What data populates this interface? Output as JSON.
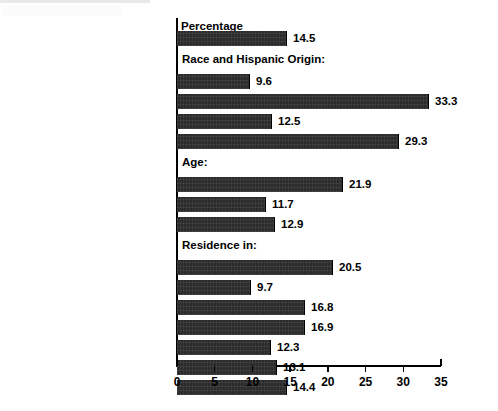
{
  "chart_data": {
    "type": "bar",
    "orientation": "horizontal",
    "title": "Percentage",
    "xlabel": "",
    "ylabel": "",
    "xlim": [
      0,
      35
    ],
    "xticks": [
      0,
      5,
      10,
      15,
      20,
      25,
      30,
      35
    ],
    "grid": false,
    "legend": null,
    "bar_color": "#2b2b2b",
    "rows": [
      {
        "kind": "bar",
        "label": "All Persons",
        "value": 14.5,
        "value_text": "14.5"
      },
      {
        "kind": "header",
        "label": "Race and Hispanic Origin:"
      },
      {
        "kind": "bar",
        "label": "White (non-Hispanic)",
        "value": 9.6,
        "value_text": "9.6"
      },
      {
        "kind": "bar",
        "label": "Black",
        "value": 33.3,
        "value_text": "33.3"
      },
      {
        "kind": "bar",
        "label": "Asian and Pacific Islander",
        "value": 12.5,
        "value_text": "12.5"
      },
      {
        "kind": "bar",
        "label": "Hispanic Origin",
        "value": 29.3,
        "value_text": "29.3"
      },
      {
        "kind": "header",
        "label": "Age:"
      },
      {
        "kind": "bar",
        "label": "Under 18 Years",
        "value": 21.9,
        "value_text": "21.9"
      },
      {
        "kind": "bar",
        "label": "18 to 64 Years",
        "value": 11.7,
        "value_text": "11.7"
      },
      {
        "kind": "bar",
        "label": "65 Years and Over",
        "value": 12.9,
        "value_text": "12.9"
      },
      {
        "kind": "header",
        "label": "Residence in:"
      },
      {
        "kind": "bar",
        "label": "Central Cities",
        "value": 20.5,
        "value_text": "20.5"
      },
      {
        "kind": "bar",
        "label": "Suburban Areas",
        "value": 9.7,
        "value_text": "9.7"
      },
      {
        "kind": "bar",
        "label": "Nonmetropolitan (rural) Areas",
        "value": 16.8,
        "value_text": "16.8"
      },
      {
        "kind": "bar",
        "label": "South",
        "value": 16.9,
        "value_text": "16.9"
      },
      {
        "kind": "bar",
        "label": "Northeast",
        "value": 12.3,
        "value_text": "12.3"
      },
      {
        "kind": "bar",
        "label": "Midwest",
        "value": 13.1,
        "value_text": "13.1"
      },
      {
        "kind": "bar",
        "label": "West",
        "value": 14.4,
        "value_text": "14.4"
      }
    ],
    "categories": [
      "All Persons",
      "White (non-Hispanic)",
      "Black",
      "Asian and Pacific Islander",
      "Hispanic Origin",
      "Under 18 Years",
      "18 to 64 Years",
      "65 Years and Over",
      "Central Cities",
      "Suburban Areas",
      "Nonmetropolitan (rural) Areas",
      "South",
      "Northeast",
      "Midwest",
      "West"
    ],
    "values": [
      14.5,
      9.6,
      33.3,
      12.5,
      29.3,
      21.9,
      11.7,
      12.9,
      20.5,
      9.7,
      16.8,
      16.9,
      12.3,
      13.1,
      14.4
    ]
  }
}
